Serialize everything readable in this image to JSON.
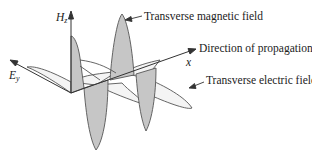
{
  "figure": {
    "axes": {
      "hz": {
        "symbol": "H",
        "subscript": "z"
      },
      "ey": {
        "symbol": "E",
        "subscript": "y"
      },
      "x": {
        "symbol": "x"
      }
    },
    "annotations": {
      "magnetic": "Transverse magnetic field",
      "propagation": "Direction of propagation",
      "electric": "Transverse electric field"
    },
    "colors": {
      "stroke": "#555555",
      "magnetic_fill": "#c8c8c8",
      "electric_fill": "#f2f2f2",
      "text": "#222222"
    }
  }
}
